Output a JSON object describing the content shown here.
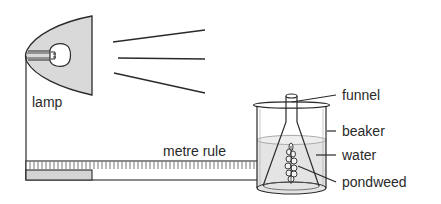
{
  "diagram": {
    "labels": {
      "lamp": "lamp",
      "metre_rule": "metre rule",
      "funnel": "funnel",
      "beaker": "beaker",
      "water": "water",
      "pondweed": "pondweed"
    },
    "components": [
      "lamp",
      "light-rays",
      "metre-rule",
      "beaker",
      "funnel",
      "water",
      "pondweed"
    ],
    "colors": {
      "stroke": "#2a2a2a",
      "lamp_fill": "#d9d9d9",
      "water_fill": "#e4e4e4",
      "ruler_block": "#d4d4d4",
      "background": "#ffffff"
    }
  }
}
